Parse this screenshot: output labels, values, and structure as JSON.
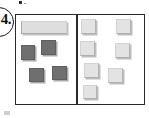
{
  "figure": {
    "label": "4.",
    "label_shape": "circle"
  },
  "frame": {
    "border_color": "#2a2a2a",
    "background": "#ffffff",
    "divider": true
  },
  "colors": {
    "dark_tile": "#6f6f6f",
    "light_tile": "#e3e3e3",
    "bar_tile": "#dedede",
    "outline": "#2a2a2a",
    "page_background": "#ffffff"
  },
  "panels": [
    {
      "name": "left-panel",
      "items": [
        {
          "kind": "bar",
          "x": 5,
          "y": 6,
          "w": 46,
          "h": 13
        },
        {
          "kind": "dark",
          "x": 5,
          "y": 30,
          "w": 14,
          "h": 15
        },
        {
          "kind": "dark",
          "x": 25,
          "y": 25,
          "w": 15,
          "h": 15
        },
        {
          "kind": "dark",
          "x": 13,
          "y": 53,
          "w": 15,
          "h": 14
        },
        {
          "kind": "dark",
          "x": 36,
          "y": 51,
          "w": 15,
          "h": 14
        }
      ]
    },
    {
      "name": "right-panel",
      "items": [
        {
          "kind": "light",
          "x": 3,
          "y": 4,
          "w": 15,
          "h": 15
        },
        {
          "kind": "light",
          "x": 38,
          "y": 4,
          "w": 15,
          "h": 15
        },
        {
          "kind": "light",
          "x": 2,
          "y": 26,
          "w": 15,
          "h": 15
        },
        {
          "kind": "light",
          "x": 37,
          "y": 28,
          "w": 15,
          "h": 15
        },
        {
          "kind": "light",
          "x": 6,
          "y": 48,
          "w": 15,
          "h": 15
        },
        {
          "kind": "light",
          "x": 30,
          "y": 53,
          "w": 15,
          "h": 15
        },
        {
          "kind": "light",
          "x": 5,
          "y": 70,
          "w": 14,
          "h": 14
        }
      ]
    }
  ],
  "specks": [
    {
      "name": "speck-top",
      "x": 19,
      "y": 1,
      "w": 3,
      "h": 3
    },
    {
      "name": "speck-top2",
      "x": 24,
      "y": 3,
      "w": 2,
      "h": 1
    },
    {
      "name": "speck-bottom",
      "x": 4,
      "y": 111,
      "w": 6,
      "h": 4
    }
  ]
}
